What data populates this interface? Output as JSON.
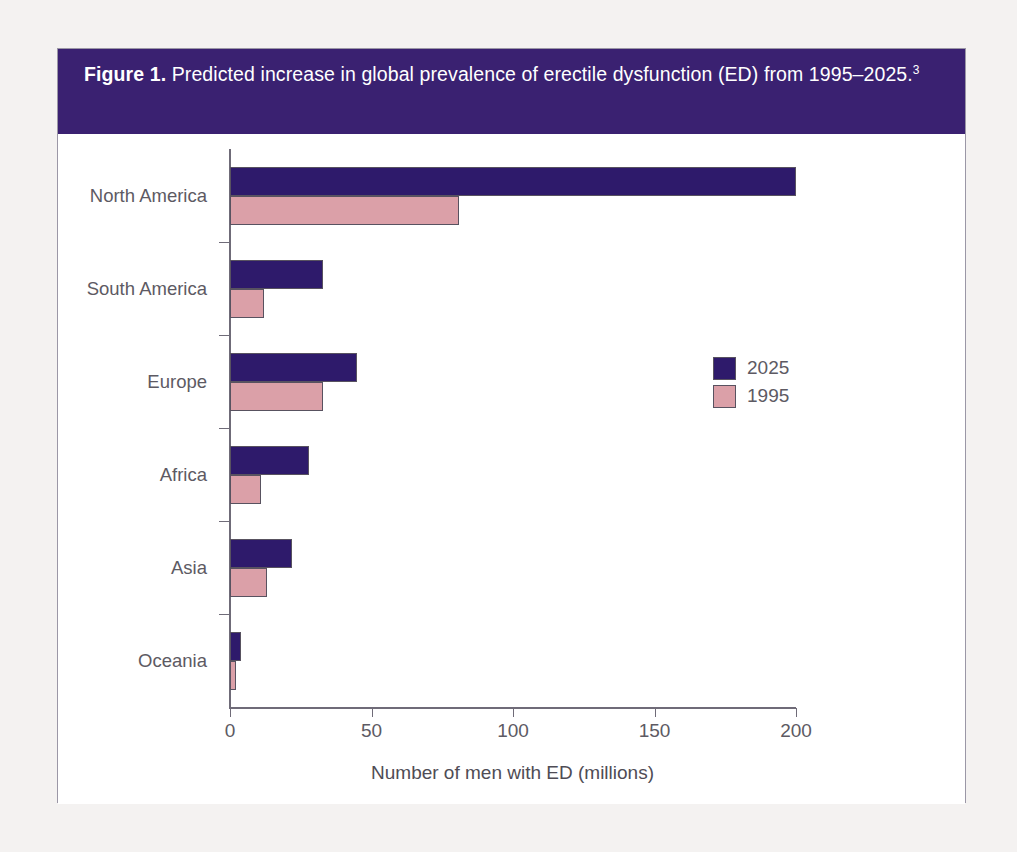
{
  "figure": {
    "label": "Figure 1.",
    "caption": " Predicted increase in global prevalence of erectile dysfunction (ED) from 1995–2025.",
    "reference_superscript": "3",
    "band_color": "#3a2171",
    "frame_color": "#9b97a6"
  },
  "legend": {
    "position": "inside-right",
    "entries": [
      {
        "label": "2025",
        "color": "#2e1a6b"
      },
      {
        "label": "1995",
        "color": "#dba0a8"
      }
    ]
  },
  "chart_data": {
    "type": "bar",
    "orientation": "horizontal",
    "title": "Predicted increase in global prevalence of erectile dysfunction (ED) from 1995–2025.",
    "xlabel": "Number of men with ED (millions)",
    "ylabel": "",
    "xlim": [
      0,
      200
    ],
    "xticks": [
      0,
      50,
      100,
      150,
      200
    ],
    "xtick_labels": [
      "0",
      "50",
      "100",
      "150",
      "200"
    ],
    "grid": false,
    "categories": [
      "North America",
      "South America",
      "Europe",
      "Africa",
      "Asia",
      "Oceania"
    ],
    "series": [
      {
        "name": "2025",
        "color": "#2e1a6b",
        "values": [
          200,
          33,
          45,
          28,
          22,
          4
        ]
      },
      {
        "name": "1995",
        "color": "#dba0a8",
        "values": [
          81,
          12,
          33,
          11,
          13,
          2
        ]
      }
    ]
  }
}
